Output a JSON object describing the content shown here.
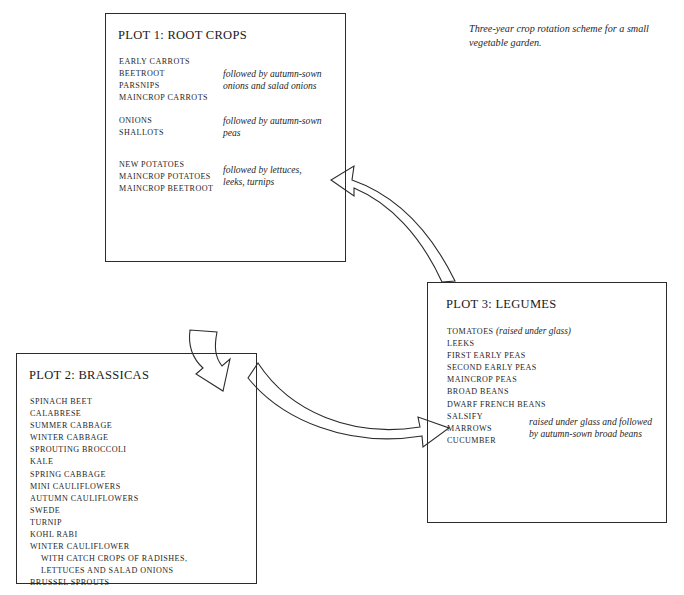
{
  "caption": "Three-year crop rotation scheme for a small vegetable garden.",
  "plots": [
    {
      "id": "plot1",
      "title": "PLOT 1: ROOT CROPS",
      "groups": [
        {
          "crops": [
            "EARLY CARROTS",
            "BEETROOT",
            "PARSNIPS",
            "MAINCROP CARROTS"
          ],
          "annotation": "followed by autumn-sown\nonions and salad onions"
        },
        {
          "crops": [
            "ONIONS",
            "SHALLOTS"
          ],
          "annotation": "followed by autumn-sown\npeas"
        },
        {
          "crops": [
            "NEW POTATOES",
            "MAINCROP POTATOES",
            "MAINCROP BEETROOT"
          ],
          "annotation": "followed by lettuces,\nleeks, turnips"
        }
      ]
    },
    {
      "id": "plot2",
      "title": "PLOT 2: BRASSICAS",
      "crops": [
        "SPINACH BEET",
        "CALABRESE",
        "SUMMER CABBAGE",
        "WINTER CABBAGE",
        "SPROUTING BROCCOLI",
        "KALE",
        "SPRING CABBAGE",
        "MINI CAULIFLOWERS",
        "AUTUMN CAULIFLOWERS",
        "SWEDE",
        "TURNIP",
        "KOHL RABI",
        "WINTER CAULIFLOWER",
        "WITH CATCH CROPS OF RADISHES,",
        "LETTUCES AND SALAD ONIONS",
        "BRUSSEL SPROUTS"
      ],
      "indented_lines": [
        13,
        14
      ]
    },
    {
      "id": "plot3",
      "title": "PLOT 3: LEGUMES",
      "first_crop": "TOMATOES",
      "first_crop_note": "(raised under glass)",
      "crops": [
        "LEEKS",
        "FIRST EARLY PEAS",
        "SECOND EARLY PEAS",
        "MAINCROP PEAS",
        "BROAD BEANS",
        "DWARF FRENCH BEANS",
        "SALSIFY",
        "MARROWS",
        "CUCUMBER"
      ],
      "annotation": "raised under glass and followed\nby autumn-sown broad beans"
    }
  ],
  "arrows": [
    {
      "name": "arrow-plot1-to-plot2",
      "from": "PLOT 1: ROOT CROPS",
      "to": "PLOT 2: BRASSICAS"
    },
    {
      "name": "arrow-plot2-to-plot3",
      "from": "PLOT 2: BRASSICAS",
      "to": "PLOT 3: LEGUMES"
    },
    {
      "name": "arrow-plot3-to-plot1",
      "from": "PLOT 3: LEGUMES",
      "to": "PLOT 1: ROOT CROPS"
    }
  ],
  "colors": {
    "line": "#2b2b2b",
    "text": "#1f1f1f",
    "background": "#ffffff"
  }
}
